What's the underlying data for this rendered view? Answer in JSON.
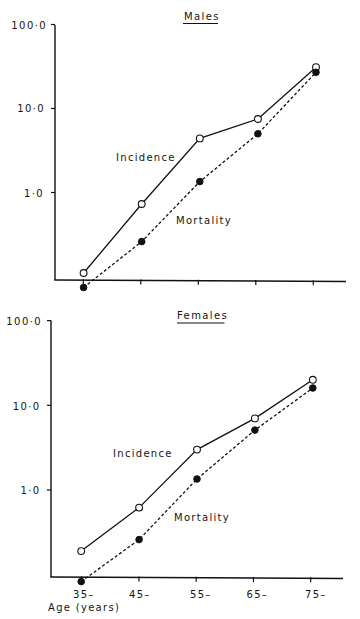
{
  "figure": {
    "x_axis_label": "Age (years)"
  },
  "chart_data": [
    {
      "type": "line",
      "title": "Males",
      "xlabel": "",
      "ylabel": "",
      "yscale": "log",
      "ylim": [
        0.087,
        100
      ],
      "grid": false,
      "legend": "inline labels",
      "categories": [
        "35–",
        "45–",
        "55–",
        "65–",
        "75–"
      ],
      "categories_shown": false,
      "yticks": [
        {
          "value": 100,
          "label": "100·0"
        },
        {
          "value": 10,
          "label": "10·0"
        },
        {
          "value": 1,
          "label": "1·0"
        }
      ],
      "series": [
        {
          "name": "Incidence",
          "line": "solid",
          "marker": "open-circle",
          "values": [
            0.11,
            0.73,
            4.4,
            7.5,
            31
          ]
        },
        {
          "name": "Mortality",
          "line": "dashed",
          "marker": "filled-circle",
          "values": [
            0.074,
            0.26,
            1.35,
            5.0,
            27
          ]
        }
      ]
    },
    {
      "type": "line",
      "title": "Females",
      "xlabel": "Age (years)",
      "ylabel": "",
      "yscale": "log",
      "ylim": [
        0.082,
        100
      ],
      "grid": false,
      "legend": "inline labels",
      "categories": [
        "35–",
        "45–",
        "55–",
        "65–",
        "75–"
      ],
      "categories_shown": true,
      "yticks": [
        {
          "value": 100,
          "label": "100·0"
        },
        {
          "value": 10,
          "label": "10·0"
        },
        {
          "value": 1,
          "label": "1·0"
        }
      ],
      "series": [
        {
          "name": "Incidence",
          "line": "solid",
          "marker": "open-circle",
          "values": [
            0.19,
            0.62,
            3.0,
            7.0,
            20
          ]
        },
        {
          "name": "Mortality",
          "line": "dashed",
          "marker": "filled-circle",
          "values": [
            0.083,
            0.26,
            1.35,
            5.1,
            16
          ]
        }
      ]
    }
  ]
}
